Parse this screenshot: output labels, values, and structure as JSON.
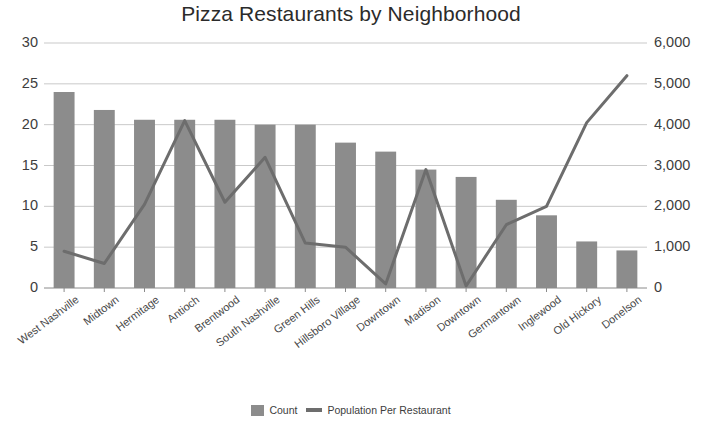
{
  "chart_data": {
    "type": "bar",
    "title": "Pizza Restaurants by Neighborhood",
    "xlabel": "",
    "ylabel": "",
    "categories": [
      "West Nashville",
      "Midtown",
      "Hermitage",
      "Antioch",
      "Brentwood",
      "South Nashville",
      "Green Hills",
      "Hillsboro Village",
      "Downtown",
      "Madison",
      "Downtown",
      "Germantown",
      "Inglewood",
      "Old Hickory",
      "Donelson"
    ],
    "series": [
      {
        "name": "Count",
        "type": "bar",
        "axis": "left",
        "color": "#8c8c8c",
        "values": [
          24,
          21.8,
          20.6,
          20.6,
          20.6,
          20,
          20,
          17.8,
          16.7,
          14.5,
          13.6,
          10.8,
          8.9,
          5.7,
          4.6
        ]
      },
      {
        "name": "Population Per Restaurant",
        "type": "line",
        "axis": "right",
        "color": "#6d6d6d",
        "values": [
          900,
          600,
          2050,
          4100,
          2100,
          3200,
          1100,
          1000,
          100,
          2900,
          50,
          1550,
          2000,
          4050,
          5200
        ]
      }
    ],
    "left_axis": {
      "ticks": [
        "0",
        "5",
        "10",
        "15",
        "20",
        "25",
        "30"
      ],
      "tick_values": [
        0,
        5,
        10,
        15,
        20,
        25,
        30
      ],
      "min": 0,
      "max": 30
    },
    "right_axis": {
      "ticks": [
        "0",
        "1,000",
        "2,000",
        "3,000",
        "4,000",
        "5,000",
        "6,000"
      ],
      "tick_values": [
        0,
        1000,
        2000,
        3000,
        4000,
        5000,
        6000
      ],
      "min": 0,
      "max": 6000
    },
    "grid": true,
    "legend_position": "bottom",
    "legend": [
      "Count",
      "Population Per Restaurant"
    ]
  }
}
